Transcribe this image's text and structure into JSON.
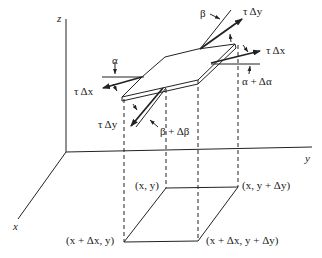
{
  "diagram": {
    "type": "3d-membrane-element",
    "axes": {
      "x": "x",
      "y": "y",
      "z": "z"
    },
    "base_corners": {
      "xy": "(x, y)",
      "x_ydy": "(x, y + Δy)",
      "xdx_y": "(x + Δx, y)",
      "xdx_ydy": "(x + Δx, y + Δy)"
    },
    "forces": {
      "tau_dx_left": "τ Δx",
      "tau_dx_right": "τ Δx",
      "tau_dy_front": "τ Δy",
      "tau_dy_back": "τ Δy"
    },
    "angles": {
      "alpha": "α",
      "alpha_plus": "α + Δα",
      "beta": "β",
      "beta_plus": "β + Δβ"
    },
    "colors": {
      "line": "#222222",
      "background": "#ffffff"
    }
  }
}
